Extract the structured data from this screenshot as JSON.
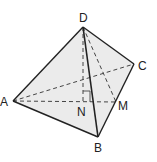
{
  "diagram": {
    "type": "tetrahedron",
    "colors": {
      "fill": "#ebebeb",
      "edge": "#222222",
      "hidden_edge": "#444444",
      "label": "#222222",
      "background": "#ffffff"
    },
    "vertices": {
      "D": {
        "label": "D",
        "x": 83,
        "y": 27
      },
      "A": {
        "label": "A",
        "x": 13,
        "y": 101
      },
      "B": {
        "label": "B",
        "x": 98,
        "y": 137
      },
      "C": {
        "label": "C",
        "x": 134,
        "y": 64
      }
    },
    "points": {
      "N": {
        "label": "N",
        "x": 83,
        "y": 102
      },
      "M": {
        "label": "M",
        "x": 116,
        "y": 102
      }
    },
    "solid_edges": [
      "DA",
      "DB",
      "DC",
      "AB",
      "BC"
    ],
    "dashed_edges": [
      "AC",
      "AM",
      "DN",
      "DM"
    ],
    "right_angle_at": "N"
  }
}
